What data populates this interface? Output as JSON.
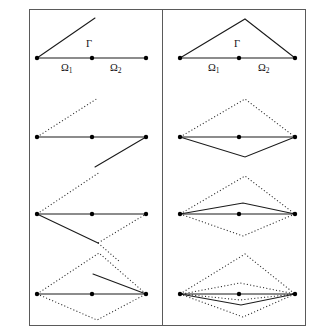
{
  "figure": {
    "title": "",
    "background_color": "#ffffff",
    "frame": {
      "x": 29,
      "y": 9,
      "width": 276,
      "height": 316,
      "stroke_color": "#5a5a5a",
      "divider_x": 162
    },
    "colors": {
      "solid_edge": "#1a1a1a",
      "dotted_edge": "#2a2a2a",
      "node": "#000000",
      "frame": "#5a5a5a"
    },
    "panels": [
      {
        "id": "left-panel",
        "name": "left-column"
      },
      {
        "id": "right-panel",
        "name": "right-column"
      }
    ],
    "labels": {
      "gamma": "Γ",
      "omega1": "Ω",
      "omega1_sub": "1",
      "omega2": "Ω",
      "omega2_sub": "2"
    },
    "label_positions": {
      "left_gamma": {
        "x": 86,
        "y": 39
      },
      "left_omega1": {
        "x": 61,
        "y": 63
      },
      "left_omega2": {
        "x": 110,
        "y": 63
      },
      "right_gamma": {
        "x": 234,
        "y": 39
      },
      "right_omega1": {
        "x": 208,
        "y": 63
      },
      "right_omega2": {
        "x": 258,
        "y": 63
      }
    },
    "rows": [
      {
        "name": "row-1",
        "left": {
          "baseline": {
            "x1": 37,
            "y1": 58,
            "x2": 146,
            "y2": 58
          },
          "nodes": [
            {
              "x": 37,
              "y": 58
            },
            {
              "x": 92,
              "y": 58
            },
            {
              "x": 146,
              "y": 58
            }
          ],
          "solid_paths": [
            "37,58 95,18"
          ],
          "dotted_paths": []
        },
        "right": {
          "baseline": {
            "x1": 180,
            "y1": 58,
            "x2": 295,
            "y2": 58
          },
          "nodes": [
            {
              "x": 180,
              "y": 58
            },
            {
              "x": 239,
              "y": 58
            },
            {
              "x": 295,
              "y": 58
            }
          ],
          "solid_paths": [
            "180,58 245,19 295,58"
          ],
          "dotted_paths": []
        }
      },
      {
        "name": "row-2",
        "left": {
          "baseline": {
            "x1": 37,
            "y1": 137,
            "x2": 146,
            "y2": 137
          },
          "nodes": [
            {
              "x": 37,
              "y": 137
            },
            {
              "x": 92,
              "y": 137
            },
            {
              "x": 146,
              "y": 137
            }
          ],
          "solid_paths": [
            "146,137 95,167"
          ],
          "dotted_paths": [
            "37,137 98,98"
          ]
        },
        "right": {
          "baseline": {
            "x1": 180,
            "y1": 137,
            "x2": 295,
            "y2": 137
          },
          "nodes": [
            {
              "x": 180,
              "y": 137
            },
            {
              "x": 239,
              "y": 137
            },
            {
              "x": 295,
              "y": 137
            }
          ],
          "solid_paths": [
            "180,137 245,157 295,137"
          ],
          "dotted_paths": [
            "180,137 245,99 295,137"
          ]
        }
      },
      {
        "name": "row-3",
        "left": {
          "baseline": {
            "x1": 37,
            "y1": 214,
            "x2": 146,
            "y2": 214
          },
          "nodes": [
            {
              "x": 37,
              "y": 214
            },
            {
              "x": 92,
              "y": 214
            },
            {
              "x": 146,
              "y": 214
            }
          ],
          "solid_paths": [
            "37,214 98,243"
          ],
          "dotted_paths": [
            "37,214 100,172",
            "98,243 146,214",
            "98,243 120,262"
          ]
        },
        "right": {
          "baseline": {
            "x1": 180,
            "y1": 214,
            "x2": 295,
            "y2": 214
          },
          "nodes": [
            {
              "x": 180,
              "y": 214
            },
            {
              "x": 239,
              "y": 214
            },
            {
              "x": 295,
              "y": 214
            }
          ],
          "solid_paths": [
            "180,214 243,203 295,214"
          ],
          "dotted_paths": [
            "180,214 245,176 295,214",
            "180,214 243,236 295,214"
          ]
        }
      },
      {
        "name": "row-4",
        "left": {
          "baseline": {
            "x1": 37,
            "y1": 294,
            "x2": 146,
            "y2": 294
          },
          "nodes": [
            {
              "x": 37,
              "y": 294
            },
            {
              "x": 92,
              "y": 294
            },
            {
              "x": 146,
              "y": 294
            }
          ],
          "solid_paths": [
            "146,294 93,274"
          ],
          "dotted_paths": [
            "37,294 99,253 146,294",
            "37,294 97,320 146,294"
          ]
        },
        "right": {
          "baseline": {
            "x1": 180,
            "y1": 294,
            "x2": 295,
            "y2": 294
          },
          "nodes": [
            {
              "x": 180,
              "y": 294
            },
            {
              "x": 239,
              "y": 294
            },
            {
              "x": 295,
              "y": 294
            }
          ],
          "solid_paths": [
            "180,294 241,305 295,294"
          ],
          "dotted_paths": [
            "180,294 245,254 295,294",
            "180,294 243,317 295,294",
            "182,294 240,283 295,294",
            "182,294 240,300 295,294"
          ]
        }
      }
    ]
  }
}
